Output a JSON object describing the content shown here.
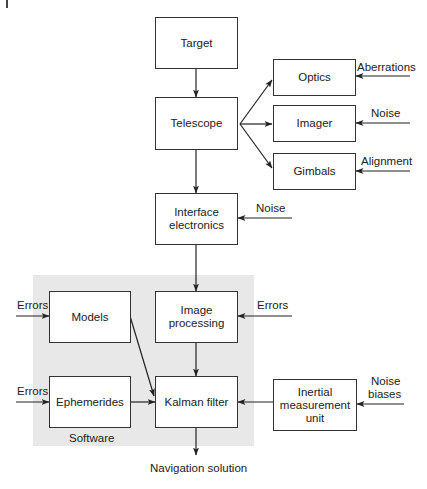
{
  "diagram": {
    "type": "block-diagram",
    "group": {
      "label": "Software",
      "color": "#e8e8e8"
    },
    "blocks": {
      "target": "Target",
      "telescope": "Telescope",
      "optics": "Optics",
      "imager": "Imager",
      "gimbals": "Gimbals",
      "interface_electronics": "Interface electronics",
      "models": "Models",
      "image_processing": "Image processing",
      "ephemerides": "Ephemerides",
      "kalman_filter": "Kalman filter",
      "imu": "Inertial measurement unit"
    },
    "inputs": {
      "optics": "Aberrations",
      "imager": "Noise",
      "gimbals": "Alignment",
      "interface_electronics": "Noise",
      "models": "Errors",
      "image_processing": "Errors",
      "ephemerides": "Errors",
      "imu_line1": "Noise",
      "imu_line2": "biases"
    },
    "output": "Navigation solution",
    "edges": [
      [
        "Target",
        "Telescope"
      ],
      [
        "Telescope",
        "Optics"
      ],
      [
        "Telescope",
        "Imager"
      ],
      [
        "Telescope",
        "Gimbals"
      ],
      [
        "Telescope",
        "Interface electronics"
      ],
      [
        "Interface electronics",
        "Image processing"
      ],
      [
        "Image processing",
        "Kalman filter"
      ],
      [
        "Models",
        "Kalman filter"
      ],
      [
        "Ephemerides",
        "Kalman filter"
      ],
      [
        "Inertial measurement unit",
        "Kalman filter"
      ],
      [
        "Kalman filter",
        "Navigation solution"
      ]
    ]
  }
}
